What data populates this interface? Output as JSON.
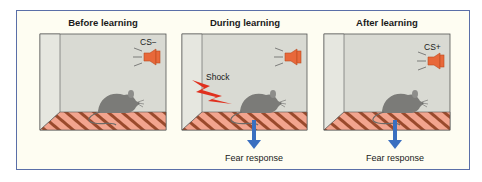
{
  "figure": {
    "colors": {
      "frame_border": "#5a6fa8",
      "frame_bg": "#fefdf2",
      "wall_back": "#d9dad3",
      "wall_side": "#e6e7e0",
      "floor_stripe_light": "#f2a48e",
      "floor_stripe_dark": "#9a4a2c",
      "speaker": "#e8683a",
      "shock": "#e0301e",
      "arrow": "#3a6fc0",
      "rat": "#7b7b78"
    },
    "panels": [
      {
        "title": "Before learning",
        "stimulus_label": "CS−",
        "shock_label": null,
        "response_label": null,
        "icons": [
          "speaker-icon",
          "rat-icon"
        ]
      },
      {
        "title": "During learning",
        "stimulus_label": null,
        "shock_label": "Shock",
        "response_label": "Fear response",
        "icons": [
          "speaker-icon",
          "lightning-bolt-icon",
          "rat-icon",
          "down-arrow-icon"
        ]
      },
      {
        "title": "After learning",
        "stimulus_label": "CS+",
        "shock_label": null,
        "response_label": "Fear response",
        "icons": [
          "speaker-icon",
          "rat-icon",
          "down-arrow-icon"
        ]
      }
    ]
  }
}
